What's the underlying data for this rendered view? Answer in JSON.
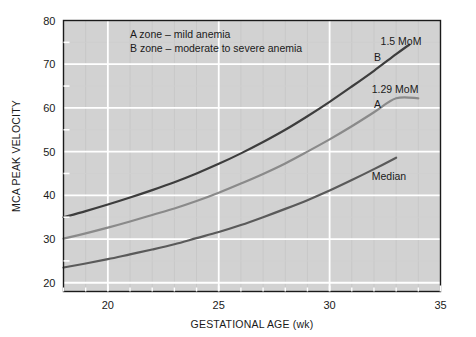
{
  "chart_data": {
    "type": "line",
    "title": "",
    "xlabel": "GESTATIONAL AGE (wk)",
    "ylabel": "MCA PEAK VELOCITY",
    "xlim": [
      18,
      35
    ],
    "ylim": [
      18,
      80
    ],
    "xticks": [
      20,
      25,
      30,
      35
    ],
    "xtick_labels": [
      "20",
      "25",
      "30",
      "35"
    ],
    "yticks": [
      20,
      30,
      40,
      50,
      60,
      70,
      80
    ],
    "ytick_labels": [
      "20",
      "30",
      "40",
      "50",
      "60",
      "70",
      "80"
    ],
    "x_minor_step": 1,
    "y_minor_step": 5,
    "grid": true,
    "grid_color": "#ffffff",
    "plot_background": "#d2d2d2",
    "legend_position": "inside-top-left",
    "annotations": [
      {
        "name": "legend-line-a",
        "text": "A zone – mild anemia",
        "x": 21.0,
        "y": 77.0
      },
      {
        "name": "legend-line-b",
        "text": "B zone – moderate to severe anemia",
        "x": 21.0,
        "y": 73.6
      },
      {
        "name": "label-1-5-mom",
        "text": "1.5 MoM",
        "x": 32.3,
        "y": 75.4
      },
      {
        "name": "label-b",
        "text": "B",
        "x": 32.0,
        "y": 71.6
      },
      {
        "name": "label-1-29-mom",
        "text": "1.29 MoM",
        "x": 31.9,
        "y": 64.4
      },
      {
        "name": "label-a",
        "text": "A",
        "x": 32.0,
        "y": 60.8
      },
      {
        "name": "label-median",
        "text": "Median",
        "x": 31.9,
        "y": 44.5
      }
    ],
    "series": [
      {
        "name": "1.5 MoM",
        "zone_label": "B",
        "color": "#3d3d3d",
        "linewidth": 2.2,
        "x": [
          18,
          19,
          20,
          21,
          22,
          23,
          24,
          25,
          26,
          27,
          28,
          29,
          30,
          31,
          32,
          33,
          33.6
        ],
        "values": [
          35.0,
          36.4,
          37.9,
          39.5,
          41.2,
          43.0,
          45.0,
          47.2,
          49.6,
          52.2,
          55.0,
          58.1,
          61.4,
          64.9,
          68.5,
          72.3,
          74.5
        ]
      },
      {
        "name": "1.29 MoM",
        "zone_label": "A",
        "color": "#8a8a8a",
        "linewidth": 2.2,
        "x": [
          18,
          19,
          20,
          21,
          22,
          23,
          24,
          25,
          26,
          27,
          28,
          29,
          30,
          31,
          32,
          33,
          34
        ],
        "values": [
          30.1,
          31.3,
          32.6,
          34.0,
          35.5,
          37.0,
          38.7,
          40.6,
          42.7,
          44.9,
          47.3,
          50.0,
          52.8,
          55.8,
          59.0,
          62.2,
          62.2
        ]
      },
      {
        "name": "Median",
        "zone_label": "Median",
        "color": "#5a5a5a",
        "linewidth": 2.2,
        "x": [
          18,
          19,
          20,
          21,
          22,
          23,
          24,
          25,
          26,
          27,
          28,
          29,
          30,
          31,
          32,
          33
        ],
        "values": [
          23.5,
          24.4,
          25.4,
          26.5,
          27.6,
          28.8,
          30.2,
          31.6,
          33.2,
          35.0,
          36.9,
          38.9,
          41.1,
          43.5,
          46.0,
          48.6
        ]
      }
    ]
  }
}
